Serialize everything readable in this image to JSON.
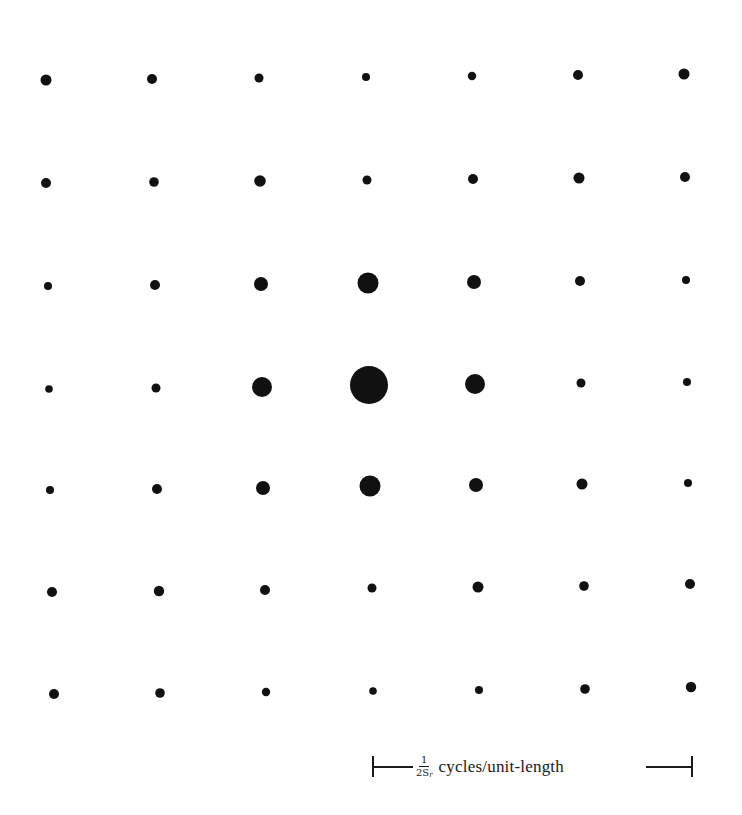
{
  "figure": {
    "type": "lattice-dot-diagram",
    "dot_color": "#111111",
    "background_color": "#ffffff"
  },
  "grid": {
    "rows": 7,
    "cols": 7,
    "dots": [
      [
        {
          "x": 46,
          "y": 80,
          "r": 5.5
        },
        {
          "x": 152,
          "y": 79,
          "r": 5
        },
        {
          "x": 259,
          "y": 78,
          "r": 4.5
        },
        {
          "x": 366,
          "y": 77,
          "r": 4
        },
        {
          "x": 472,
          "y": 76,
          "r": 4.2
        },
        {
          "x": 578,
          "y": 75,
          "r": 5
        },
        {
          "x": 684,
          "y": 74,
          "r": 5.5
        }
      ],
      [
        {
          "x": 46,
          "y": 183,
          "r": 5
        },
        {
          "x": 154,
          "y": 182,
          "r": 4.8
        },
        {
          "x": 260,
          "y": 181,
          "r": 5.8
        },
        {
          "x": 367,
          "y": 180,
          "r": 4.5
        },
        {
          "x": 473,
          "y": 179,
          "r": 5
        },
        {
          "x": 579,
          "y": 178,
          "r": 5.5
        },
        {
          "x": 685,
          "y": 177,
          "r": 5
        }
      ],
      [
        {
          "x": 48,
          "y": 286,
          "r": 4
        },
        {
          "x": 155,
          "y": 285,
          "r": 5
        },
        {
          "x": 261,
          "y": 284,
          "r": 7
        },
        {
          "x": 368,
          "y": 283,
          "r": 10.5
        },
        {
          "x": 474,
          "y": 282,
          "r": 7
        },
        {
          "x": 580,
          "y": 281,
          "r": 5
        },
        {
          "x": 686,
          "y": 280,
          "r": 4
        }
      ],
      [
        {
          "x": 49,
          "y": 389,
          "r": 3.8
        },
        {
          "x": 156,
          "y": 388,
          "r": 4.5
        },
        {
          "x": 262,
          "y": 387,
          "r": 10
        },
        {
          "x": 369,
          "y": 385,
          "r": 19
        },
        {
          "x": 475,
          "y": 384,
          "r": 10
        },
        {
          "x": 581,
          "y": 383,
          "r": 4.5
        },
        {
          "x": 687,
          "y": 382,
          "r": 4
        }
      ],
      [
        {
          "x": 50,
          "y": 490,
          "r": 4
        },
        {
          "x": 157,
          "y": 489,
          "r": 5
        },
        {
          "x": 263,
          "y": 488,
          "r": 7
        },
        {
          "x": 370,
          "y": 486,
          "r": 10.5
        },
        {
          "x": 476,
          "y": 485,
          "r": 7
        },
        {
          "x": 582,
          "y": 484,
          "r": 5.5
        },
        {
          "x": 688,
          "y": 483,
          "r": 4
        }
      ],
      [
        {
          "x": 52,
          "y": 592,
          "r": 5
        },
        {
          "x": 159,
          "y": 591,
          "r": 5.2
        },
        {
          "x": 265,
          "y": 590,
          "r": 5
        },
        {
          "x": 372,
          "y": 588,
          "r": 4.5
        },
        {
          "x": 478,
          "y": 587,
          "r": 5.5
        },
        {
          "x": 584,
          "y": 586,
          "r": 4.8
        },
        {
          "x": 690,
          "y": 584,
          "r": 5
        }
      ],
      [
        {
          "x": 54,
          "y": 694,
          "r": 5
        },
        {
          "x": 160,
          "y": 693,
          "r": 4.8
        },
        {
          "x": 266,
          "y": 692,
          "r": 4.2
        },
        {
          "x": 373,
          "y": 691,
          "r": 3.8
        },
        {
          "x": 479,
          "y": 690,
          "r": 4
        },
        {
          "x": 585,
          "y": 689,
          "r": 4.8
        },
        {
          "x": 691,
          "y": 687,
          "r": 5.2
        }
      ]
    ]
  },
  "scale_bar": {
    "fraction_numerator": "1",
    "fraction_denominator_base": "2S",
    "fraction_denominator_subscript": "r",
    "units_label": "cycles/unit-length"
  }
}
